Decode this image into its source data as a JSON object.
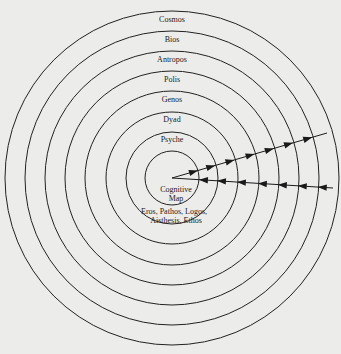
{
  "diagram": {
    "type": "concentric-circles",
    "center": {
      "x": 172,
      "y": 178
    },
    "rings": [
      {
        "label": "Cosmos",
        "radius": 167
      },
      {
        "label": "Bios",
        "radius": 147
      },
      {
        "label": "Antropos",
        "radius": 127
      },
      {
        "label": "Polis",
        "radius": 107
      },
      {
        "label": "Genos",
        "radius": 87
      },
      {
        "label": "Dyad",
        "radius": 66
      },
      {
        "label": "Psyche",
        "radius": 46
      },
      {
        "label": "",
        "radius": 27
      }
    ],
    "core": {
      "title_line1": "Cognitive",
      "title_line2": "Map",
      "sub_line1": "Eros, Pathos, Logos,",
      "sub_line2": "Aisthesis, Ethos"
    },
    "arrows": {
      "outward": {
        "from": [
          172,
          178
        ],
        "to": [
          327,
          133
        ],
        "direction": "outward"
      },
      "inward": {
        "from": [
          333,
          188
        ],
        "to": [
          172,
          178
        ],
        "direction": "inward"
      }
    },
    "colors": {
      "line": "#1a1a1a",
      "background": "#ececea"
    }
  }
}
